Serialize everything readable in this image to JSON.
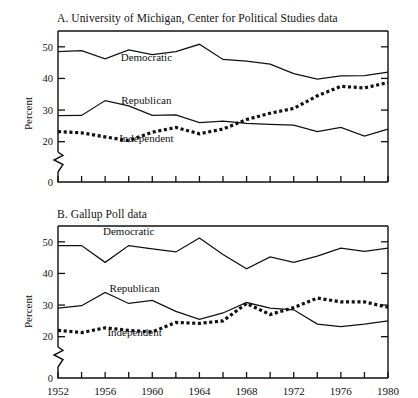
{
  "figure": {
    "ylabel": "Percent",
    "xtick_labels": [
      "1952",
      "1956",
      "1960",
      "1964",
      "1968",
      "1972",
      "1976",
      "1980"
    ],
    "ytick_labels": [
      "0",
      "20",
      "30",
      "40",
      "50"
    ],
    "series_labels": {
      "democratic": "Democratic",
      "republican": "Republican",
      "independent": "Independent"
    }
  },
  "chart_data": [
    {
      "type": "line",
      "title": "A. University of Michigan, Center for Political Studies data",
      "xlabel": "",
      "ylabel": "Percent",
      "xlim": [
        1952,
        1980
      ],
      "ylim": [
        18,
        55
      ],
      "yticks": [
        0,
        20,
        30,
        40,
        50
      ],
      "axis_break": true,
      "xticks": [
        1952,
        1954,
        1956,
        1958,
        1960,
        1962,
        1964,
        1966,
        1968,
        1970,
        1972,
        1974,
        1976,
        1978,
        1980
      ],
      "xtick_labels_every": 4,
      "grid": false,
      "legend": "inline-annotations",
      "x": [
        1952,
        1954,
        1956,
        1958,
        1960,
        1962,
        1964,
        1966,
        1968,
        1970,
        1972,
        1974,
        1976,
        1978,
        1980
      ],
      "series": [
        {
          "name": "Democratic",
          "style": "solid",
          "values": [
            48.5,
            48.8,
            46.2,
            49.0,
            47.5,
            48.5,
            50.8,
            46.0,
            45.5,
            44.5,
            41.5,
            39.8,
            40.8,
            40.9,
            42.0
          ]
        },
        {
          "name": "Republican",
          "style": "solid",
          "values": [
            28.2,
            28.3,
            33.0,
            31.3,
            28.3,
            28.5,
            26.0,
            26.5,
            25.8,
            25.5,
            25.2,
            23.2,
            24.5,
            21.8,
            24.0
          ]
        },
        {
          "name": "Independent",
          "style": "dotted",
          "values": [
            23.2,
            22.8,
            21.5,
            20.3,
            23.0,
            24.5,
            22.5,
            24.0,
            27.0,
            29.0,
            30.5,
            34.5,
            37.5,
            37.0,
            38.7
          ]
        }
      ],
      "annotations": [
        {
          "text": "Democratic",
          "x": 1959.5,
          "y": 45.5
        },
        {
          "text": "Republican",
          "x": 1959.5,
          "y": 32.0
        },
        {
          "text": "Independent",
          "x": 1959.5,
          "y": 19.8
        }
      ]
    },
    {
      "type": "line",
      "title": "B. Gallup Poll data",
      "xlabel": "",
      "ylabel": "Percent",
      "xlim": [
        1952,
        1980
      ],
      "ylim": [
        18,
        55
      ],
      "yticks": [
        0,
        20,
        30,
        40,
        50
      ],
      "axis_break": true,
      "xticks": [
        1952,
        1954,
        1956,
        1958,
        1960,
        1962,
        1964,
        1966,
        1968,
        1970,
        1972,
        1974,
        1976,
        1978,
        1980
      ],
      "xtick_labels_every": 4,
      "grid": false,
      "legend": "inline-annotations",
      "x": [
        1952,
        1954,
        1956,
        1958,
        1960,
        1962,
        1964,
        1966,
        1968,
        1970,
        1972,
        1974,
        1976,
        1978,
        1980
      ],
      "series": [
        {
          "name": "Democratic",
          "style": "solid",
          "values": [
            48.8,
            48.8,
            43.5,
            48.8,
            47.8,
            46.8,
            51.2,
            46.0,
            41.5,
            45.2,
            43.5,
            45.5,
            48.0,
            47.0,
            48.0
          ]
        },
        {
          "name": "Republican",
          "style": "solid",
          "values": [
            29.0,
            29.8,
            34.0,
            30.5,
            31.5,
            28.0,
            25.5,
            27.5,
            30.8,
            29.0,
            28.5,
            24.0,
            23.2,
            24.0,
            25.0
          ]
        },
        {
          "name": "Independent",
          "style": "dotted",
          "values": [
            22.0,
            21.3,
            22.8,
            22.0,
            21.5,
            24.5,
            24.2,
            25.0,
            30.5,
            27.0,
            29.2,
            32.2,
            31.0,
            31.0,
            29.3
          ]
        }
      ],
      "annotations": [
        {
          "text": "Democratic",
          "x": 1958.0,
          "y": 52.0
        },
        {
          "text": "Republican",
          "x": 1958.5,
          "y": 34.2
        },
        {
          "text": "Independent",
          "x": 1958.5,
          "y": 20.3
        }
      ]
    }
  ]
}
